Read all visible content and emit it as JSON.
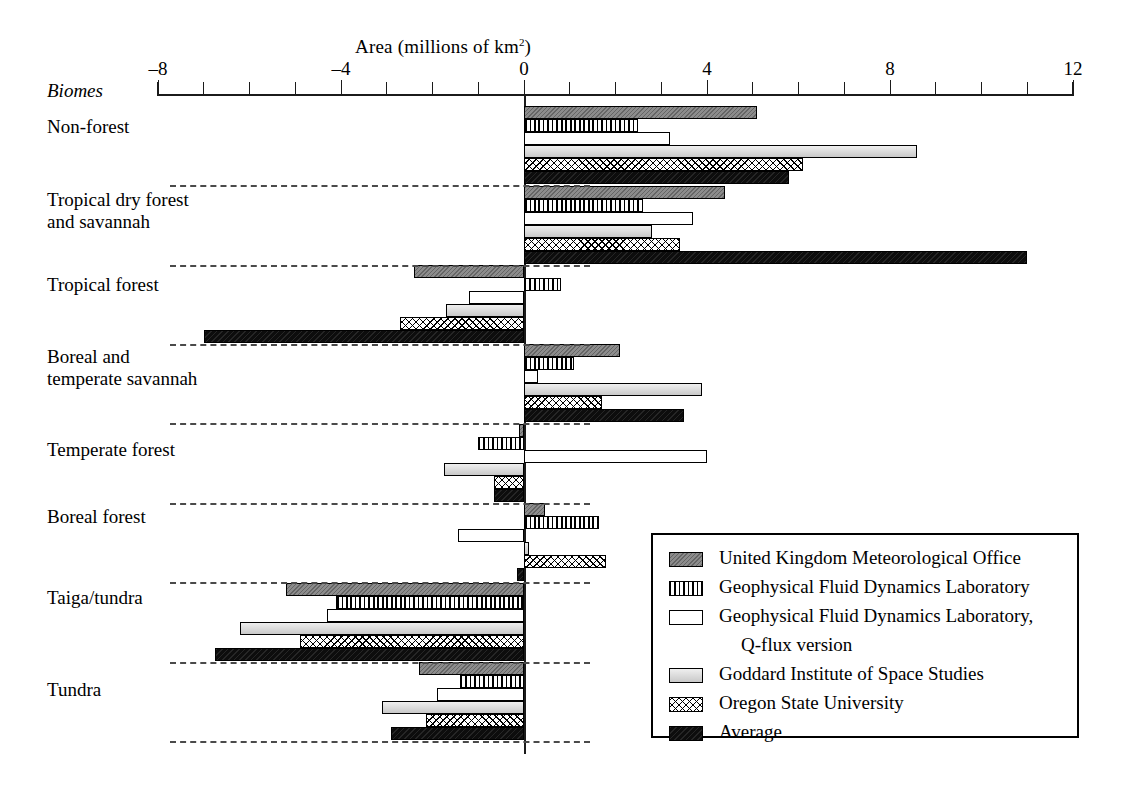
{
  "chart_data": {
    "type": "bar",
    "orientation": "horizontal",
    "title": "Area (millions of km2)",
    "title_display": "Area (millions of km²)",
    "xlabel": "Area (millions of km2)",
    "ylabel": "Biomes",
    "xlim": [
      -8,
      12
    ],
    "xticks": [
      -8,
      -7,
      -6,
      -5,
      -4,
      -3,
      -2,
      -1,
      0,
      1,
      2,
      3,
      4,
      5,
      6,
      7,
      8,
      9,
      10,
      11,
      12
    ],
    "xtick_labels": [
      "-8",
      "",
      "",
      "",
      "-4",
      "",
      "",
      "",
      "0",
      "",
      "",
      "",
      "4",
      "",
      "",
      "",
      "8",
      "",
      "",
      "",
      "12"
    ],
    "grid": false,
    "legend_position": "lower-right",
    "categories": [
      "Non-forest",
      "Tropical dry forest and savannah",
      "Tropical forest",
      "Boreal and temperate savannah",
      "Temperate forest",
      "Boreal forest",
      "Taiga/tundra",
      "Tundra"
    ],
    "series": [
      {
        "name": "United Kingdom Meteorological Office",
        "key": "ukmo",
        "values": [
          5.1,
          4.4,
          -2.4,
          2.1,
          -0.1,
          0.45,
          -5.2,
          -2.3
        ]
      },
      {
        "name": "Geophysical Fluid Dynamics Laboratory",
        "key": "gfdl",
        "values": [
          2.5,
          2.6,
          0.8,
          1.1,
          -1.0,
          1.65,
          -4.1,
          -1.4
        ]
      },
      {
        "name": "Geophysical Fluid Dynamics Laboratory, Q-flux version",
        "key": "gfdlq",
        "values": [
          3.2,
          3.7,
          -1.2,
          0.3,
          4.0,
          -1.45,
          -4.3,
          -1.9
        ]
      },
      {
        "name": "Goddard Institute of Space Studies",
        "key": "giss",
        "values": [
          8.6,
          2.8,
          -1.7,
          3.9,
          -1.75,
          0.1,
          -6.2,
          -3.1
        ]
      },
      {
        "name": "Oregon State University",
        "key": "osu",
        "values": [
          6.1,
          3.4,
          -2.7,
          1.7,
          -0.65,
          1.8,
          -4.9,
          -2.15
        ]
      },
      {
        "name": "Average",
        "key": "avg",
        "values": [
          5.8,
          11.0,
          -7.0,
          3.5,
          -0.65,
          -0.15,
          -6.75,
          -2.9
        ]
      }
    ]
  },
  "axis": {
    "biomes_label": "Biomes",
    "title_prefix": "Area (millions of km",
    "title_sup": "2",
    "title_suffix": ")"
  },
  "legend": {
    "entries": [
      {
        "label": "United Kingdom Meteorological Office",
        "cont": "",
        "swatch": "ukmo"
      },
      {
        "label": "Geophysical Fluid Dynamics Laboratory",
        "cont": "",
        "swatch": "gfdl"
      },
      {
        "label": "Geophysical Fluid Dynamics Laboratory,",
        "cont": "Q-flux version",
        "swatch": "gfdlq"
      },
      {
        "label": "Goddard Institute of Space Studies",
        "cont": "",
        "swatch": "giss"
      },
      {
        "label": "Oregon State University",
        "cont": "",
        "swatch": "osu"
      },
      {
        "label": "Average",
        "cont": "",
        "swatch": "avg"
      }
    ]
  },
  "colors": {
    "ukmo": "#8c8c8c",
    "gfdl": "#ffffff",
    "gfdlq": "#ffffff",
    "giss": "#dcdcdc",
    "osu": "#ffffff",
    "avg": "#0d0d0d",
    "axis": "#1b1b1b",
    "separator": "#4a4a4a"
  }
}
